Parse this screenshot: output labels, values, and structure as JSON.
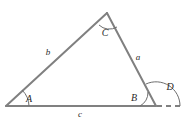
{
  "figure": {
    "kind": "geometry-diagram",
    "colors": {
      "stroke": "#808080",
      "arc": "#6e6e6e",
      "label": "#2b2b2b",
      "background": "#ffffff"
    },
    "stroke_width": 2,
    "arc_stroke_width": 1,
    "vertices": [
      {
        "name": "A",
        "x": 6,
        "y": 106
      },
      {
        "name": "C",
        "x": 107,
        "y": 13
      },
      {
        "name": "B",
        "x": 156,
        "y": 106
      }
    ],
    "dashed_extension": {
      "from_x": 156,
      "from_y": 106,
      "to_x": 184,
      "to_y": 106
    },
    "side_labels": [
      {
        "text": "b",
        "x": 48,
        "y": 52
      },
      {
        "text": "a",
        "x": 138,
        "y": 57
      },
      {
        "text": "c",
        "x": 80,
        "y": 114
      }
    ],
    "angle_labels": [
      {
        "text": "A",
        "x": 29,
        "y": 99
      },
      {
        "text": "C",
        "x": 105,
        "y": 33
      },
      {
        "text": "B",
        "x": 134,
        "y": 98
      },
      {
        "text": "D",
        "x": 170,
        "y": 87
      }
    ]
  }
}
